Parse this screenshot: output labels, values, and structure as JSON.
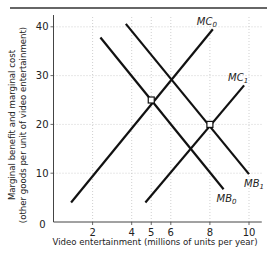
{
  "chart_data": {
    "type": "line",
    "title": "",
    "xlabel": "Video entertainment (millions of units per year)",
    "ylabel_line1": "Marginal benefit and marginal cost",
    "ylabel_line2": "(other goods per unit of video entertainment)",
    "xlim": [
      0,
      10.5
    ],
    "ylim": [
      0,
      42
    ],
    "x_ticks": [
      2,
      4,
      5,
      6,
      8,
      10
    ],
    "x_tick_labels": [
      "2",
      "4",
      "5",
      "6",
      "8",
      "10"
    ],
    "y_ticks": [
      0,
      10,
      20,
      30,
      40
    ],
    "y_tick_labels": [
      "0",
      "10",
      "20",
      "30",
      "40"
    ],
    "grid": true,
    "legend": "none (curves labeled directly)",
    "series": [
      {
        "name": "MC0",
        "label_main": "MC",
        "label_sub": "0",
        "points": [
          [
            0.9,
            4
          ],
          [
            8.15,
            39.5
          ]
        ]
      },
      {
        "name": "MC1",
        "label_main": "MC",
        "label_sub": "1",
        "points": [
          [
            4.7,
            4
          ],
          [
            9.75,
            28
          ]
        ]
      },
      {
        "name": "MB0",
        "label_main": "MB",
        "label_sub": "0",
        "points": [
          [
            2.4,
            37.8
          ],
          [
            8.7,
            6.7
          ]
        ]
      },
      {
        "name": "MB1",
        "label_main": "MB",
        "label_sub": "1",
        "points": [
          [
            3.7,
            40.6
          ],
          [
            10,
            9.8
          ]
        ]
      }
    ],
    "annotations": [
      {
        "type": "marker",
        "shape": "square",
        "x": 5,
        "y": 25,
        "note": "MB0 = MC0 intersection"
      },
      {
        "type": "marker",
        "shape": "square",
        "x": 8,
        "y": 20,
        "note": "MB1 = MC1 intersection"
      }
    ]
  }
}
